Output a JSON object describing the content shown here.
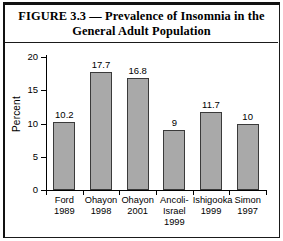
{
  "figure": {
    "title": "FIGURE 3.3 — Prevalence of Insomnia in the General Adult Population"
  },
  "chart_data": {
    "type": "bar",
    "title": "FIGURE 3.3 — Prevalence of Insomnia in the General Adult Population",
    "xlabel": "",
    "ylabel": "Percent",
    "ylim": [
      0,
      20
    ],
    "yticks": [
      "0",
      "5",
      "10",
      "15",
      "20"
    ],
    "grid": false,
    "legend": "none",
    "bar_color": "#a9a9a9",
    "bar_edge_color": "#3a3a3a",
    "categories": [
      "Ford\n1989",
      "Ohayon\n1998",
      "Ohayon\n2001",
      "Ancoli-\nIsrael\n1999",
      "Ishigooka\n1999",
      "Simon\n1997"
    ],
    "values": [
      10.2,
      17.7,
      16.8,
      9,
      11.7,
      10
    ],
    "value_labels": [
      "10.2",
      "17.7",
      "16.8",
      "9",
      "11.7",
      "10"
    ]
  }
}
